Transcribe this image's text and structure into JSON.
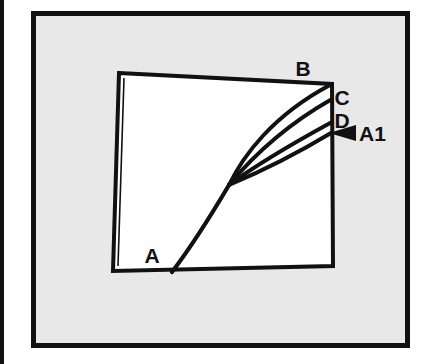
{
  "figure": {
    "background_color": "#ffffff",
    "panel_fill": "#e8e8e8",
    "plot_fill": "#ffffff",
    "ink_color": "#111111",
    "outer_frame": {
      "name": "outer-frame",
      "x": 31,
      "y": 11,
      "width": 379,
      "height": 337,
      "stroke_width": 5
    },
    "left_margin_bar": {
      "name": "left-margin-bar",
      "x": 0,
      "y": 0,
      "width": 4,
      "height": 364
    },
    "plot_quadrilateral": {
      "name": "plot-quadrilateral",
      "corners": {
        "top_left": [
          119,
          73
        ],
        "top_right": [
          332,
          84
        ],
        "bottom_right": [
          333,
          266
        ],
        "bottom_left": [
          113,
          271
        ]
      },
      "stroke_width": 4
    },
    "junction_point": [
      229,
      185
    ],
    "curves": [
      {
        "id": "A",
        "label": "A",
        "role": "stem",
        "start": [
          172,
          272
        ],
        "end": [
          229,
          185
        ],
        "label_position": [
          152,
          263
        ]
      },
      {
        "id": "B",
        "label": "B",
        "role": "branch",
        "start": [
          229,
          185
        ],
        "end": [
          330,
          85
        ],
        "label_position": [
          297,
          76
        ]
      },
      {
        "id": "C",
        "label": "C",
        "role": "branch",
        "start": [
          229,
          185
        ],
        "end": [
          332,
          99
        ],
        "label_position": [
          338,
          105
        ]
      },
      {
        "id": "D",
        "label": "D",
        "role": "branch",
        "start": [
          229,
          185
        ],
        "end": [
          332,
          122
        ],
        "label_position": [
          338,
          127
        ]
      },
      {
        "id": "A1",
        "label": "A1",
        "role": "branch",
        "start": [
          229,
          185
        ],
        "end": [
          331,
          133
        ],
        "label_position": [
          358,
          140
        ]
      }
    ],
    "arrow": {
      "name": "a1-arrow",
      "tip": [
        329,
        133
      ],
      "tail": [
        355,
        133
      ],
      "half_height": 8,
      "points_to": "A1"
    },
    "labels": {
      "A": "A",
      "B": "B",
      "C": "C",
      "D": "D",
      "A1": "A1"
    },
    "label_font_size": 21
  }
}
